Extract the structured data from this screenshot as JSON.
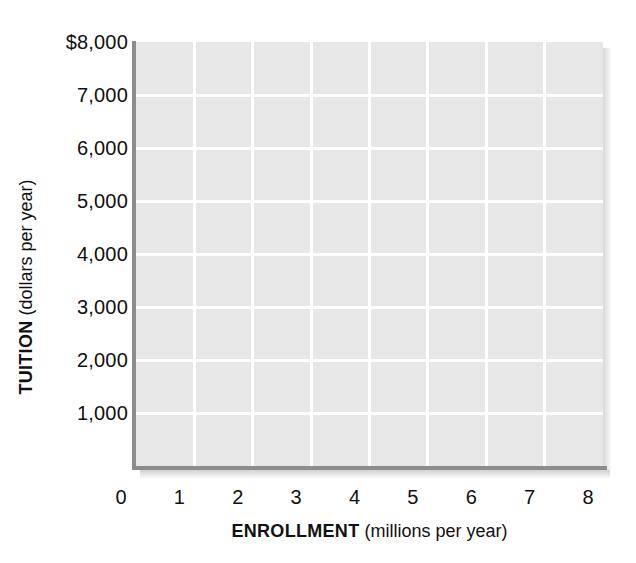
{
  "chart_data": {
    "type": "line",
    "title": "",
    "subtitle": "",
    "xlabel_bold": "ENROLLMENT",
    "xlabel_rest": " (millions per year)",
    "ylabel_bold": "TUITION",
    "ylabel_rest": " (dollars per year)",
    "xlim": [
      0,
      8
    ],
    "ylim": [
      0,
      8000
    ],
    "x_ticks": [
      0,
      1,
      2,
      3,
      4,
      5,
      6,
      7,
      8
    ],
    "x_tick_labels": [
      "0",
      "1",
      "2",
      "3",
      "4",
      "5",
      "6",
      "7",
      "8"
    ],
    "y_ticks": [
      1000,
      2000,
      3000,
      4000,
      5000,
      6000,
      7000,
      8000
    ],
    "y_tick_labels": [
      "1,000",
      "2,000",
      "3,000",
      "4,000",
      "5,000",
      "6,000",
      "7,000",
      "$8,000"
    ],
    "grid": true,
    "grid_color": "#ffffff",
    "plot_background": "#e7e7e7",
    "axis_color": "#8c8c8c",
    "legend": null,
    "legend_position": "none",
    "series": [],
    "annotations": [],
    "note": "Blank grid template: axes and gridlines only, no data plotted."
  },
  "axes": {
    "y_title": {
      "bold": "TUITION",
      "rest": " (dollars per year)"
    },
    "x_title": {
      "bold": "ENROLLMENT",
      "rest": " (millions per year)"
    }
  },
  "ticks": {
    "y": [
      {
        "label": "$8,000",
        "value": 8000
      },
      {
        "label": "7,000",
        "value": 7000
      },
      {
        "label": "6,000",
        "value": 6000
      },
      {
        "label": "5,000",
        "value": 5000
      },
      {
        "label": "4,000",
        "value": 4000
      },
      {
        "label": "3,000",
        "value": 3000
      },
      {
        "label": "2,000",
        "value": 2000
      },
      {
        "label": "1,000",
        "value": 1000
      }
    ],
    "x": [
      {
        "label": "0",
        "value": 0
      },
      {
        "label": "1",
        "value": 1
      },
      {
        "label": "2",
        "value": 2
      },
      {
        "label": "3",
        "value": 3
      },
      {
        "label": "4",
        "value": 4
      },
      {
        "label": "5",
        "value": 5
      },
      {
        "label": "6",
        "value": 6
      },
      {
        "label": "7",
        "value": 7
      },
      {
        "label": "8",
        "value": 8
      }
    ]
  }
}
